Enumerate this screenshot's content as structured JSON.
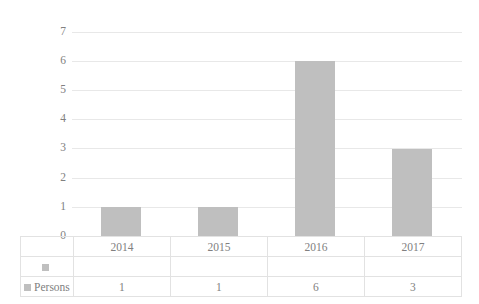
{
  "chart_data": {
    "type": "bar",
    "title": "",
    "subtitle": "",
    "xlabel": "",
    "ylabel": "",
    "categories": [
      "2014",
      "2015",
      "2016",
      "2017"
    ],
    "series": [
      {
        "name": "",
        "values": [
          null,
          null,
          null,
          null
        ]
      },
      {
        "name": "Persons",
        "values": [
          1,
          1,
          6,
          3
        ]
      }
    ],
    "values": [
      1,
      1,
      6,
      3
    ],
    "ylim": [
      0,
      7
    ],
    "ytick_labels": [
      "0",
      "1",
      "2",
      "3",
      "4",
      "5",
      "6",
      "7"
    ],
    "grid": true,
    "legend_position": "data-table",
    "data_table_visible": true,
    "colors": {
      "bar": "#bfbfbf",
      "gridline": "#e8e8e8",
      "axis": "#d9d9d9",
      "text": "#808080",
      "table_border": "#e2e2e2",
      "background": "#ffffff"
    }
  },
  "data_table": {
    "header_row": [
      "2014",
      "2015",
      "2016",
      "2017"
    ],
    "rows": [
      {
        "label": "",
        "marker": "series-marker-blank",
        "cells": [
          "",
          "",
          "",
          ""
        ]
      },
      {
        "label": "Persons",
        "marker": "series-marker-persons",
        "cells": [
          "1",
          "1",
          "6",
          "3"
        ]
      }
    ]
  }
}
